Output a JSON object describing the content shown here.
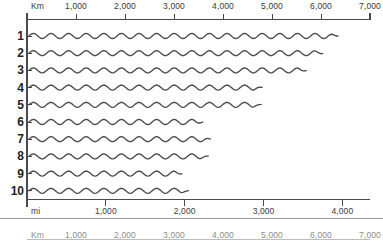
{
  "figure": {
    "background_color": "#ffffff",
    "line_color": "#4a4a4a",
    "axis_color": "#4a4a4a"
  },
  "top_axis": {
    "unit_label": "Km",
    "name": "kilometers-axis",
    "min": 0,
    "max": 7000,
    "ticks": [
      {
        "value": 0,
        "label": ""
      },
      {
        "value": 1000,
        "label": "1,000"
      },
      {
        "value": 2000,
        "label": "2,000"
      },
      {
        "value": 3000,
        "label": "3,000"
      },
      {
        "value": 4000,
        "label": "4,000"
      },
      {
        "value": 5000,
        "label": "5,000"
      },
      {
        "value": 6000,
        "label": "6,000"
      },
      {
        "value": 7000,
        "label": "7,000"
      }
    ]
  },
  "bottom_axis": {
    "unit_label": "mi",
    "name": "miles-axis",
    "min": 0,
    "max": 4350,
    "ticks": [
      {
        "value": 0,
        "label": ""
      },
      {
        "value": 1000,
        "label": "1,000"
      },
      {
        "value": 2000,
        "label": "2,000"
      },
      {
        "value": 3000,
        "label": "3,000"
      },
      {
        "value": 4000,
        "label": "4,000"
      }
    ]
  },
  "clipped_axis": {
    "unit_label": "Km",
    "name": "clipped-kilometers-axis",
    "ticks": [
      {
        "value": 1000,
        "label": "1,000"
      },
      {
        "value": 2000,
        "label": "2,000"
      },
      {
        "value": 3000,
        "label": "3,000"
      },
      {
        "value": 4000,
        "label": "4,000"
      },
      {
        "value": 5000,
        "label": "5,000"
      },
      {
        "value": 6000,
        "label": "6,000"
      },
      {
        "value": 7000,
        "label": "7,000"
      }
    ]
  },
  "rows": [
    {
      "label": "1",
      "length_km": 6350
    },
    {
      "label": "2",
      "length_km": 6050
    },
    {
      "label": "3",
      "length_km": 5700
    },
    {
      "label": "4",
      "length_km": 4800
    },
    {
      "label": "5",
      "length_km": 4780
    },
    {
      "label": "6",
      "length_km": 3600
    },
    {
      "label": "7",
      "length_km": 3750
    },
    {
      "label": "8",
      "length_km": 3700
    },
    {
      "label": "9",
      "length_km": 3180
    },
    {
      "label": "10",
      "length_km": 3300
    }
  ],
  "chart_data": {
    "type": "bar",
    "title": "",
    "subtitle": "",
    "xlabel": "Km",
    "ylabel": "",
    "categories": [
      "1",
      "2",
      "3",
      "4",
      "5",
      "6",
      "7",
      "8",
      "9",
      "10"
    ],
    "values": [
      6350,
      6050,
      5700,
      4800,
      4780,
      3600,
      3750,
      3700,
      3180,
      3300
    ],
    "units_primary": "Km",
    "units_secondary": "mi",
    "xlim": [
      0,
      7000
    ],
    "xlim_secondary": [
      0,
      4350
    ],
    "grid": false,
    "legend": "none",
    "series_style": "wavy-line",
    "annotations": [
      "Top axis in kilometres, 0 to 7,000, ticks every 1,000",
      "Bottom axis in miles, 0 to about 4,350, ticks every 1,000",
      "Ten numbered wavy river-length bars of decreasing length",
      "A second kilometre axis is clipped at the bottom edge"
    ]
  }
}
